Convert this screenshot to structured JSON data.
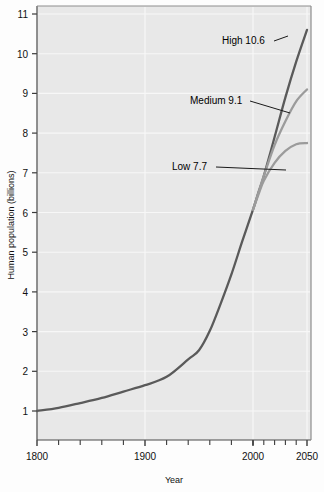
{
  "figure": {
    "background_color": "#fdfdfd",
    "plot_background_color": "#e8e8e8",
    "grid_color": "#f6f6f6",
    "axis_color": "#555555"
  },
  "chart_data": {
    "type": "line",
    "title": "",
    "xlabel": "Year",
    "ylabel": "Human population (billions)",
    "xlim": [
      1800,
      2060
    ],
    "ylim": [
      0.55,
      11.3
    ],
    "grid": true,
    "legend_position": "none",
    "x_ticks_major": [
      1800,
      1900,
      2000,
      2050
    ],
    "x_tick_labels": [
      "1800",
      "1900",
      "2000",
      "2050"
    ],
    "x_ticks_minor": [
      1820,
      1840,
      1860,
      1880,
      1920,
      1940,
      1960,
      1980,
      2000,
      2010,
      2020,
      2030,
      2040,
      2060
    ],
    "y_ticks": [
      1,
      2,
      3,
      4,
      5,
      6,
      7,
      8,
      9,
      10,
      11
    ],
    "y_tick_labels": [
      "1",
      "2",
      "3",
      "4",
      "5",
      "6",
      "7",
      "8",
      "9",
      "10",
      "11"
    ],
    "series": [
      {
        "name": "High",
        "end_value": 10.6,
        "color": "#5a5a5a",
        "x": [
          1800,
          1820,
          1840,
          1860,
          1880,
          1900,
          1920,
          1940,
          1950,
          1960,
          1970,
          1980,
          1990,
          2000,
          2005,
          2010,
          2020,
          2030,
          2040,
          2050
        ],
        "values": [
          1.0,
          1.08,
          1.2,
          1.33,
          1.49,
          1.65,
          1.86,
          2.3,
          2.53,
          3.02,
          3.7,
          4.44,
          5.27,
          6.07,
          6.5,
          6.92,
          7.9,
          8.9,
          9.8,
          10.6
        ]
      },
      {
        "name": "Medium",
        "end_value": 9.1,
        "color": "#9b9b9b",
        "x": [
          2000,
          2005,
          2010,
          2020,
          2030,
          2040,
          2050
        ],
        "values": [
          6.07,
          6.5,
          6.92,
          7.7,
          8.3,
          8.8,
          9.1
        ]
      },
      {
        "name": "Low",
        "end_value": 7.7,
        "color": "#9b9b9b",
        "x": [
          2000,
          2005,
          2010,
          2020,
          2030,
          2040,
          2050
        ],
        "values": [
          6.07,
          6.45,
          6.8,
          7.25,
          7.55,
          7.72,
          7.75
        ]
      }
    ],
    "annotations": [
      {
        "id": "high",
        "label": "High 10.6",
        "text_x": 222,
        "text_y": 44,
        "leader_from_x": 274,
        "leader_from_y": 41,
        "leader_to_x": 288,
        "leader_to_y": 36
      },
      {
        "id": "medium",
        "label": "Medium 9.1",
        "text_x": 190,
        "text_y": 104,
        "leader_from_x": 250,
        "leader_from_y": 101,
        "leader_to_x": 290,
        "leader_to_y": 113
      },
      {
        "id": "low",
        "label": "Low 7.7",
        "text_x": 172,
        "text_y": 170,
        "leader_from_x": 216,
        "leader_from_y": 167,
        "leader_to_x": 286,
        "leader_to_y": 170
      }
    ]
  }
}
